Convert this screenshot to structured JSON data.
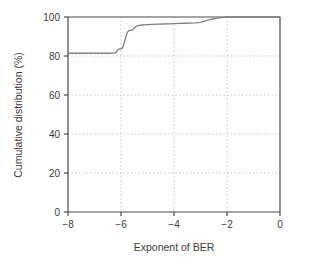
{
  "chart_data": {
    "type": "line",
    "title": "",
    "xlabel": "Exponent of BER",
    "ylabel": "Cumulative distribution (%)",
    "xlim": [
      -8,
      0
    ],
    "ylim": [
      0,
      100
    ],
    "xticks": [
      -8,
      -6,
      -4,
      -2,
      0
    ],
    "xticklabels": [
      "−8",
      "−6",
      "−4",
      "−2",
      "0"
    ],
    "yticks": [
      0,
      20,
      40,
      60,
      80,
      100
    ],
    "yticklabels": [
      "0",
      "20",
      "40",
      "60",
      "80",
      "100"
    ],
    "grid": true,
    "grid_style": "dotted",
    "legend": "none",
    "line_color": "#808080",
    "axis_color": "#4a4a4a",
    "grid_color": "#c8c8c8",
    "background": "#ffffff",
    "series": [
      {
        "name": "Cumulative distribution of BER",
        "x": [
          -8.0,
          -7.6,
          -7.2,
          -6.8,
          -6.5,
          -6.3,
          -6.2,
          -6.15,
          -6.1,
          -6.05,
          -6.0,
          -5.95,
          -5.9,
          -5.85,
          -5.8,
          -5.75,
          -5.7,
          -5.65,
          -5.6,
          -5.55,
          -5.5,
          -5.45,
          -5.4,
          -5.3,
          -5.2,
          -5.1,
          -5.0,
          -4.8,
          -4.6,
          -4.4,
          -4.2,
          -4.0,
          -3.8,
          -3.6,
          -3.4,
          -3.2,
          -3.0,
          -2.9,
          -2.8,
          -2.7,
          -2.6,
          -2.5,
          -2.4,
          -2.3,
          -2.2,
          -2.1,
          -2.0,
          -1.8,
          -1.5,
          -1.2,
          -0.9,
          -0.6,
          -0.3,
          0.0
        ],
        "y": [
          81.4,
          81.4,
          81.4,
          81.4,
          81.4,
          81.5,
          81.6,
          82.6,
          83.4,
          83.6,
          83.7,
          84.0,
          85.6,
          88.3,
          90.7,
          92.3,
          93.0,
          93.2,
          93.3,
          93.5,
          94.3,
          95.0,
          95.4,
          95.7,
          95.9,
          96.0,
          96.1,
          96.2,
          96.3,
          96.4,
          96.5,
          96.6,
          96.7,
          96.8,
          96.9,
          97.0,
          97.2,
          97.6,
          98.1,
          98.5,
          98.8,
          99.1,
          99.3,
          99.5,
          99.7,
          99.9,
          100.0,
          100.0,
          100.0,
          100.0,
          100.0,
          100.0,
          100.0,
          100.0
        ]
      }
    ],
    "annotations": [
      "Flat baseline near 81% for exponent below -6.2",
      "Sharp step rise between -6.2 and -5.5 reaching about 93%",
      "Gradual climb to 97% across -5 to -3",
      "Saturates at 100% at about -2"
    ]
  }
}
